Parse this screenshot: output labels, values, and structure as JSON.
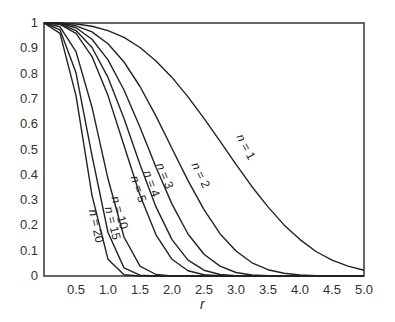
{
  "chart_data": {
    "type": "line",
    "title": "",
    "xlabel": "r",
    "ylabel": "",
    "xlim": [
      0,
      5
    ],
    "ylim": [
      0,
      1
    ],
    "grid": false,
    "legend": "inline curve labels",
    "xticks": [
      "0.5",
      "1.0",
      "1.5",
      "2.0",
      "2.5",
      "3.0",
      "3.5",
      "4.0",
      "4.5",
      "5.0"
    ],
    "yticks": [
      "0",
      "0.1",
      "0.2",
      "0.3",
      "0.4",
      "0.5",
      "0.6",
      "0.7",
      "0.8",
      "0.9",
      "1"
    ],
    "x": [
      0,
      0.25,
      0.5,
      0.75,
      1.0,
      1.25,
      1.5,
      1.75,
      2.0,
      2.25,
      2.5,
      2.75,
      3.0,
      3.25,
      3.5,
      3.75,
      4.0,
      4.25,
      4.5,
      4.75,
      5.0
    ],
    "series": [
      {
        "name": "n = 1",
        "label": "n = 1",
        "values": [
          1,
          1.0,
          0.996,
          0.987,
          0.97,
          0.943,
          0.903,
          0.85,
          0.785,
          0.708,
          0.623,
          0.533,
          0.441,
          0.353,
          0.273,
          0.202,
          0.144,
          0.097,
          0.063,
          0.039,
          0.023
        ]
      },
      {
        "name": "n = 2",
        "label": "n = 2",
        "values": [
          1,
          0.999,
          0.989,
          0.965,
          0.918,
          0.846,
          0.749,
          0.632,
          0.504,
          0.377,
          0.262,
          0.167,
          0.099,
          0.052,
          0.025,
          0.011,
          0.004,
          0.001,
          0,
          0,
          0
        ]
      },
      {
        "name": "n = 3",
        "label": "n = 3",
        "values": [
          1,
          0.998,
          0.981,
          0.936,
          0.854,
          0.735,
          0.588,
          0.43,
          0.284,
          0.166,
          0.086,
          0.039,
          0.014,
          0.004,
          0.001,
          0,
          0,
          0,
          0,
          0,
          0
        ]
      },
      {
        "name": "n = 4",
        "label": "n = 4",
        "values": [
          1,
          0.996,
          0.97,
          0.903,
          0.785,
          0.623,
          0.441,
          0.273,
          0.144,
          0.063,
          0.023,
          0.006,
          0.001,
          0,
          0,
          0,
          0,
          0,
          0,
          0,
          0
        ]
      },
      {
        "name": "n = 5",
        "label": "n = 5",
        "values": [
          1,
          0.995,
          0.959,
          0.867,
          0.713,
          0.516,
          0.319,
          0.163,
          0.066,
          0.021,
          0.005,
          0.001,
          0,
          0,
          0,
          0,
          0,
          0,
          0,
          0,
          0
        ]
      },
      {
        "name": "n = 10",
        "label": "n = 10",
        "values": [
          1,
          0.985,
          0.887,
          0.667,
          0.384,
          0.154,
          0.039,
          0.006,
          0.0005,
          0,
          0,
          0,
          0,
          0,
          0,
          0,
          0,
          0,
          0,
          0,
          0
        ]
      },
      {
        "name": "n = 15",
        "label": "n = 15",
        "values": [
          1,
          0.973,
          0.803,
          0.476,
          0.172,
          0.032,
          0.003,
          0,
          0,
          0,
          0,
          0,
          0,
          0,
          0,
          0,
          0,
          0,
          0,
          0,
          0
        ]
      },
      {
        "name": "n = 20",
        "label": "n = 20",
        "values": [
          1,
          0.959,
          0.713,
          0.319,
          0.066,
          0.005,
          0,
          0,
          0,
          0,
          0,
          0,
          0,
          0,
          0,
          0,
          0,
          0,
          0,
          0,
          0
        ]
      }
    ],
    "label_positions": [
      {
        "x": 3.0,
        "y": 0.55,
        "rot": 62
      },
      {
        "x": 2.3,
        "y": 0.44,
        "rot": 64
      },
      {
        "x": 1.75,
        "y": 0.44,
        "rot": 68
      },
      {
        "x": 1.55,
        "y": 0.41,
        "rot": 70
      },
      {
        "x": 1.35,
        "y": 0.39,
        "rot": 72
      },
      {
        "x": 1.05,
        "y": 0.31,
        "rot": 74
      },
      {
        "x": 0.95,
        "y": 0.27,
        "rot": 76
      },
      {
        "x": 0.7,
        "y": 0.26,
        "rot": 78
      }
    ]
  }
}
